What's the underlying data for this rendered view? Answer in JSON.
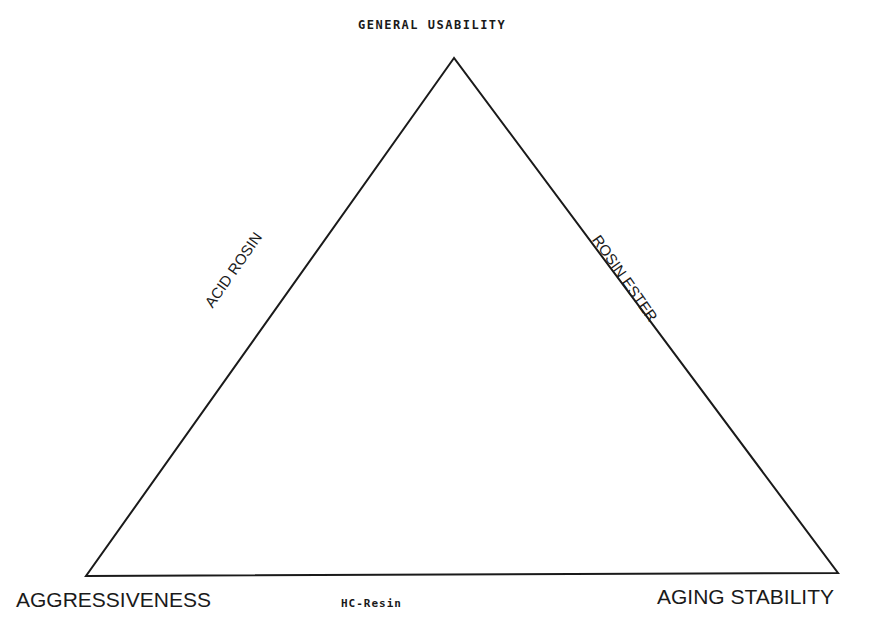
{
  "diagram": {
    "type": "triangle",
    "vertices": {
      "top": {
        "label": "GENERAL USABILITY",
        "x": 454,
        "y": 58
      },
      "bottom_left": {
        "label": "AGGRESSIVENESS",
        "x": 86,
        "y": 576
      },
      "bottom_right": {
        "label": "AGING STABILITY",
        "x": 838,
        "y": 573
      }
    },
    "edges": {
      "left": {
        "label": "ACID ROSIN"
      },
      "right": {
        "label": "ROSIN ESTER"
      },
      "bottom": {
        "label": "HC-Resin"
      }
    },
    "stroke_color": "#1a1a1a",
    "background": "#ffffff"
  }
}
